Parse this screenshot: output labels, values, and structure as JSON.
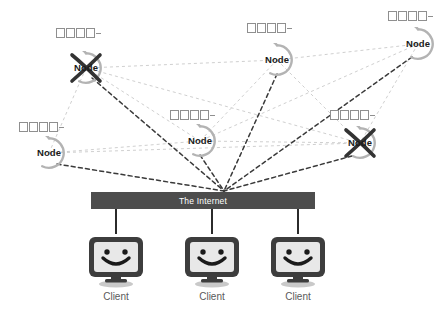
{
  "diagram": {
    "colors": {
      "bar_fill": "#4d4d4d",
      "bar_text": "#ffffff",
      "node_ring": "#b3b3b3",
      "node_text": "#1a1a1a",
      "peer_link": "#c9c9c9",
      "internet_link": "#3a3a3a",
      "client_label": "#5a5a5a",
      "monitor_bezel": "#3d3d3d",
      "monitor_screen": "#e8e8e8",
      "callout_box": "#8f8f8f",
      "cross_mark": "#333333"
    }
  },
  "nodes": [
    {
      "id": "node-top-left",
      "label": "Node",
      "x": 86,
      "y": 68,
      "callout": "□□□□",
      "crossed": true,
      "callout_dx": -30,
      "callout_dy": -40
    },
    {
      "id": "node-top-center",
      "label": "Node",
      "x": 277,
      "y": 60,
      "callout": "□□□□",
      "crossed": false,
      "callout_dx": -30,
      "callout_dy": -37
    },
    {
      "id": "node-top-right",
      "label": "Node",
      "x": 418,
      "y": 44,
      "callout": "□□□□",
      "crossed": false,
      "callout_dx": -30,
      "callout_dy": -33
    },
    {
      "id": "node-mid-left",
      "label": "Node",
      "x": 49,
      "y": 153,
      "callout": "□□□□",
      "crossed": false,
      "callout_dx": -30,
      "callout_dy": -31
    },
    {
      "id": "node-mid-center",
      "label": "Node",
      "x": 200,
      "y": 141,
      "callout": "□□□□",
      "crossed": false,
      "callout_dx": -30,
      "callout_dy": -31
    },
    {
      "id": "node-mid-right",
      "label": "Node",
      "x": 360,
      "y": 143,
      "callout": "□□□□",
      "crossed": true,
      "callout_dx": -30,
      "callout_dy": -33
    }
  ],
  "internet": {
    "label": "The Internet"
  },
  "clients": [
    {
      "id": "client-left",
      "label": "Client",
      "x": 116
    },
    {
      "id": "client-center",
      "label": "Client",
      "x": 212
    },
    {
      "id": "client-right",
      "label": "Client",
      "x": 298
    }
  ],
  "callout_glyph_count": 4,
  "hub_point": {
    "x": 224,
    "y": 191
  }
}
